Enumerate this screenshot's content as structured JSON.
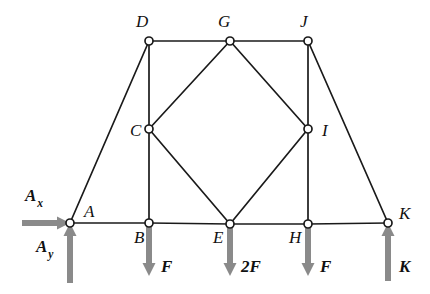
{
  "figure": {
    "colors": {
      "member": "#1a1a1a",
      "joint_fill": "#ffffff",
      "load_arrow": "#8a8a8a",
      "background": "#ffffff",
      "label": "#111111"
    },
    "joints": [
      {
        "id": "A",
        "label": "A",
        "x": 70,
        "y": 223,
        "label_x": 84,
        "label_y": 217
      },
      {
        "id": "B",
        "label": "B",
        "x": 149,
        "y": 223,
        "label_x": 134,
        "label_y": 243
      },
      {
        "id": "C",
        "label": "C",
        "x": 149,
        "y": 129,
        "label_x": 130,
        "label_y": 136
      },
      {
        "id": "D",
        "label": "D",
        "x": 149,
        "y": 41,
        "label_x": 136,
        "label_y": 27
      },
      {
        "id": "E",
        "label": "E",
        "x": 230,
        "y": 224,
        "label_x": 213,
        "label_y": 243
      },
      {
        "id": "G",
        "label": "G",
        "x": 230,
        "y": 41,
        "label_x": 218,
        "label_y": 27
      },
      {
        "id": "H",
        "label": "H",
        "x": 308,
        "y": 224,
        "label_x": 289,
        "label_y": 243
      },
      {
        "id": "I",
        "label": "I",
        "x": 308,
        "y": 129,
        "label_x": 322,
        "label_y": 136
      },
      {
        "id": "J",
        "label": "J",
        "x": 308,
        "y": 41,
        "label_x": 300,
        "label_y": 27
      },
      {
        "id": "K",
        "label": "K",
        "x": 388,
        "y": 223,
        "label_x": 399,
        "label_y": 219
      }
    ],
    "members": [
      {
        "from": "A",
        "to": "D"
      },
      {
        "from": "A",
        "to": "B"
      },
      {
        "from": "B",
        "to": "E"
      },
      {
        "from": "E",
        "to": "H"
      },
      {
        "from": "H",
        "to": "K"
      },
      {
        "from": "D",
        "to": "G"
      },
      {
        "from": "G",
        "to": "J"
      },
      {
        "from": "D",
        "to": "C"
      },
      {
        "from": "C",
        "to": "B"
      },
      {
        "from": "C",
        "to": "G"
      },
      {
        "from": "C",
        "to": "E"
      },
      {
        "from": "G",
        "to": "I"
      },
      {
        "from": "E",
        "to": "I"
      },
      {
        "from": "J",
        "to": "I"
      },
      {
        "from": "I",
        "to": "H"
      },
      {
        "from": "J",
        "to": "K"
      }
    ],
    "loads": [
      {
        "id": "Ax",
        "name": "reaction-ax",
        "label": "A",
        "sublabel": "x",
        "direction": "right",
        "tip_x": 70,
        "tip_y": 223,
        "tail_x": 22,
        "tail_y": 223,
        "label_x": 25,
        "label_y": 201
      },
      {
        "id": "Ay",
        "name": "reaction-ay",
        "label": "A",
        "sublabel": "y",
        "direction": "up",
        "tip_x": 70,
        "tip_y": 223,
        "tail_x": 70,
        "tail_y": 283,
        "label_x": 36,
        "label_y": 252
      },
      {
        "id": "F_B",
        "name": "load-f-at-b",
        "label": "F",
        "sublabel": "",
        "direction": "down",
        "tip_x": 149,
        "tip_y": 276,
        "tail_x": 149,
        "tail_y": 224,
        "label_x": 161,
        "label_y": 272
      },
      {
        "id": "2F_E",
        "name": "load-2f-at-e",
        "label": "2F",
        "sublabel": "",
        "direction": "down",
        "tip_x": 230,
        "tip_y": 276,
        "tail_x": 230,
        "tail_y": 225,
        "label_x": 241,
        "label_y": 272
      },
      {
        "id": "F_H",
        "name": "load-f-at-h",
        "label": "F",
        "sublabel": "",
        "direction": "down",
        "tip_x": 308,
        "tip_y": 276,
        "tail_x": 308,
        "tail_y": 225,
        "label_x": 320,
        "label_y": 272
      },
      {
        "id": "K_react",
        "name": "reaction-k",
        "label": "K",
        "sublabel": "",
        "direction": "up",
        "tip_x": 388,
        "tip_y": 223,
        "tail_x": 388,
        "tail_y": 281,
        "label_x": 399,
        "label_y": 272
      }
    ]
  }
}
